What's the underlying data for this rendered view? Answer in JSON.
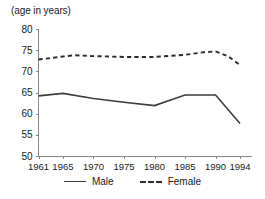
{
  "chart_data": {
    "type": "line",
    "title": "(age in years)",
    "xlabel": "",
    "ylabel": "",
    "ylim": [
      50,
      80
    ],
    "xlim": [
      1961,
      1994
    ],
    "yticks": [
      50,
      55,
      60,
      65,
      70,
      75,
      80
    ],
    "xticks": [
      1961,
      1965,
      1970,
      1975,
      1980,
      1985,
      1990,
      1994
    ],
    "grid": false,
    "legend_position": "bottom",
    "series": [
      {
        "name": "Male",
        "style": "solid",
        "color": "#3d3d3d",
        "x": [
          1961,
          1965,
          1970,
          1975,
          1980,
          1985,
          1989,
          1990,
          1994
        ],
        "values": [
          64.2,
          64.8,
          63.6,
          62.7,
          61.9,
          64.4,
          64.4,
          64.4,
          57.7
        ]
      },
      {
        "name": "Female",
        "style": "dashed",
        "color": "#2b2b2b",
        "x": [
          1961,
          1965,
          1967,
          1970,
          1975,
          1980,
          1985,
          1988,
          1990,
          1992,
          1994
        ],
        "values": [
          72.8,
          73.5,
          73.8,
          73.6,
          73.4,
          73.4,
          73.9,
          74.5,
          74.7,
          73.6,
          71.5
        ]
      }
    ]
  },
  "title": {
    "text": "(age in years)"
  },
  "yaxis": {
    "ticks": [
      "80",
      "75",
      "70",
      "65",
      "60",
      "55",
      "50"
    ]
  },
  "xaxis": {
    "ticks": [
      "1961",
      "1965",
      "1970",
      "1975",
      "1980",
      "1985",
      "1990",
      "1994"
    ]
  },
  "legend": {
    "items": [
      {
        "label": "Male",
        "style": "solid"
      },
      {
        "label": "Female",
        "style": "dashed"
      }
    ]
  },
  "colors": {
    "male_line": "#3d3d3d",
    "female_line": "#2b2b2b",
    "axis": "#8a8a8a",
    "text": "#1a1a1a",
    "background": "#ffffff"
  }
}
